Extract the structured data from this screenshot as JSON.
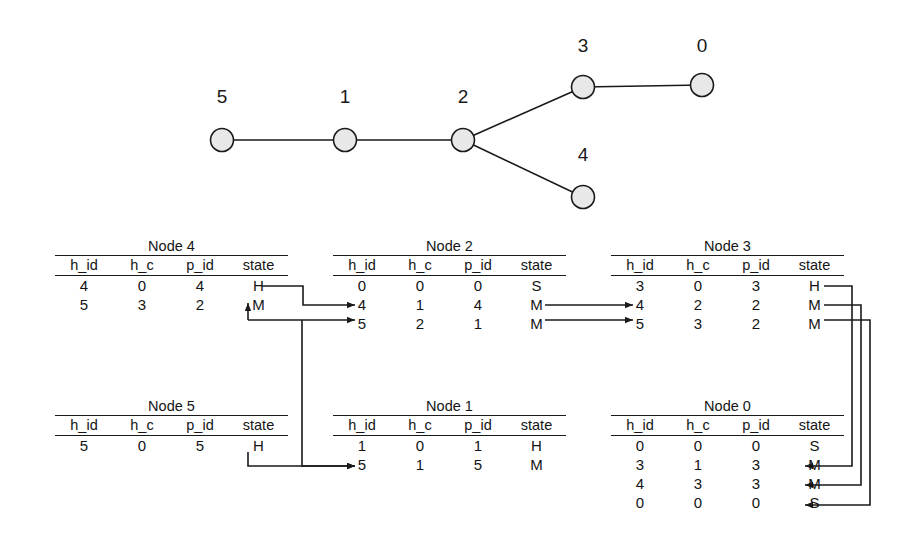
{
  "figure": {
    "background": "#ffffff",
    "line_color": "#1a1a1a",
    "node_fill": "#e8e8e8"
  },
  "graph": {
    "nodes": [
      {
        "label": "5",
        "cx": 222,
        "cy": 140,
        "lx": 222,
        "ly": 97
      },
      {
        "label": "1",
        "cx": 345,
        "cy": 140,
        "lx": 345,
        "ly": 97
      },
      {
        "label": "2",
        "cx": 463,
        "cy": 140,
        "lx": 463,
        "ly": 97
      },
      {
        "label": "3",
        "cx": 583,
        "cy": 87,
        "lx": 583,
        "ly": 46
      },
      {
        "label": "0",
        "cx": 702,
        "cy": 85,
        "lx": 702,
        "ly": 46
      },
      {
        "label": "4",
        "cx": 583,
        "cy": 197,
        "lx": 583,
        "ly": 155
      }
    ],
    "edges": [
      {
        "from": "5",
        "to": "1"
      },
      {
        "from": "1",
        "to": "2"
      },
      {
        "from": "2",
        "to": "3"
      },
      {
        "from": "2",
        "to": "4"
      },
      {
        "from": "3",
        "to": "0"
      }
    ]
  },
  "columns": [
    "h_id",
    "h_c",
    "p_id",
    "state"
  ],
  "tables": [
    {
      "id": "node4",
      "title": "Node 4",
      "x": 55,
      "y": 238,
      "rows": [
        [
          "4",
          "0",
          "4",
          "H"
        ],
        [
          "5",
          "3",
          "2",
          "M"
        ]
      ]
    },
    {
      "id": "node2",
      "title": "Node 2",
      "x": 333,
      "y": 238,
      "rows": [
        [
          "0",
          "0",
          "0",
          "S"
        ],
        [
          "4",
          "1",
          "4",
          "M"
        ],
        [
          "5",
          "2",
          "1",
          "M"
        ]
      ]
    },
    {
      "id": "node3",
      "title": "Node 3",
      "x": 611,
      "y": 238,
      "rows": [
        [
          "3",
          "0",
          "3",
          "H"
        ],
        [
          "4",
          "2",
          "2",
          "M"
        ],
        [
          "5",
          "3",
          "2",
          "M"
        ]
      ]
    },
    {
      "id": "node5",
      "title": "Node 5",
      "x": 55,
      "y": 398,
      "rows": [
        [
          "5",
          "0",
          "5",
          "H"
        ]
      ]
    },
    {
      "id": "node1",
      "title": "Node 1",
      "x": 333,
      "y": 398,
      "rows": [
        [
          "1",
          "0",
          "1",
          "H"
        ],
        [
          "5",
          "1",
          "5",
          "M"
        ]
      ]
    },
    {
      "id": "node0",
      "title": "Node 0",
      "x": 611,
      "y": 398,
      "rows": [
        [
          "0",
          "0",
          "0",
          "S"
        ],
        [
          "3",
          "1",
          "3",
          "M"
        ],
        [
          "4",
          "3",
          "3",
          "M"
        ],
        [
          "0",
          "0",
          "0",
          "S"
        ]
      ]
    }
  ],
  "connectors": [
    {
      "name": "node4-H-to-node2-row4",
      "path": "M 262 286 L 303 286 L 303 305 L 355 305",
      "arrow": "right"
    },
    {
      "name": "node4-M-from-node2-row5-line",
      "path": "M 248 320 L 355 320",
      "arrow": "right"
    },
    {
      "name": "node2-row5-up-into-node4-M",
      "path": "M 248 320 L 248 303",
      "arrow": "up"
    },
    {
      "name": "node2-M-row4-to-node3-row4",
      "path": "M 545 305 L 633 305",
      "arrow": "right"
    },
    {
      "name": "node2-M-row5-to-node3-row5",
      "path": "M 545 320 L 633 320",
      "arrow": "right"
    },
    {
      "name": "node5-H-to-node1-row5",
      "path": "M 248 452 L 248 466 L 355 466",
      "arrow": "right"
    },
    {
      "name": "node2-row5-down-to-node1-row5",
      "path": "M 302 320 L 302 466 L 355 466",
      "arrow": "right"
    },
    {
      "name": "node3-H-to-node0-row3",
      "path": "M 824 286 L 852 286 L 852 466 L 805 466",
      "arrow": "left"
    },
    {
      "name": "node3-M-row4-to-node0-row4",
      "path": "M 824 305 L 861 305 L 861 485 L 805 485",
      "arrow": "left"
    },
    {
      "name": "node3-M-row5-to-node0-row0",
      "path": "M 824 320 L 870 320 L 870 505 L 805 505",
      "arrow": "left"
    }
  ]
}
